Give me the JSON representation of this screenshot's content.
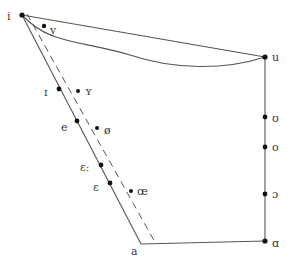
{
  "diagram": {
    "type": "vowel-quadrilateral",
    "colors": {
      "line": "#555555",
      "dot": "#111111",
      "label": "#333333",
      "background": "#ffffff"
    },
    "corners": {
      "i": {
        "label": "i",
        "x": 22,
        "y": 15,
        "lx": 7,
        "ly": 20
      },
      "u": {
        "label": "u",
        "x": 265,
        "y": 57,
        "lx": 272,
        "ly": 61
      },
      "a": {
        "label": "a",
        "x": 141,
        "y": 244,
        "lx": 131,
        "ly": 255
      },
      "ɑ": {
        "label": "ɑ",
        "x": 265,
        "y": 241,
        "lx": 272,
        "ly": 247
      }
    },
    "front_unrounded": [
      {
        "label": "ɪ",
        "x": 59,
        "y": 89,
        "lx": 44,
        "ly": 96
      },
      {
        "label": "e",
        "x": 77,
        "y": 121,
        "lx": 61,
        "ly": 131
      },
      {
        "label": "ɛː",
        "x": 101,
        "y": 165,
        "lx": 80,
        "ly": 171
      },
      {
        "label": "ɛ",
        "x": 110,
        "y": 183,
        "lx": 93,
        "ly": 191
      }
    ],
    "front_rounded": [
      {
        "label": "y",
        "x": 44,
        "y": 26,
        "lx": 50,
        "ly": 34
      },
      {
        "label": "ʏ",
        "x": 78,
        "y": 91,
        "lx": 85,
        "ly": 95
      },
      {
        "label": "ø",
        "x": 97,
        "y": 128,
        "lx": 104,
        "ly": 134
      },
      {
        "label": "œ",
        "x": 131,
        "y": 191,
        "lx": 137,
        "ly": 195
      }
    ],
    "back": [
      {
        "label": "ʊ",
        "x": 265,
        "y": 117,
        "lx": 272,
        "ly": 122
      },
      {
        "label": "o",
        "x": 265,
        "y": 147,
        "lx": 272,
        "ly": 151
      },
      {
        "label": "ɔ",
        "x": 265,
        "y": 194,
        "lx": 272,
        "ly": 198
      }
    ],
    "dashed_line": {
      "x1": 27,
      "y1": 14,
      "x2": 156,
      "y2": 244
    },
    "curve": {
      "from": "i",
      "to": "u",
      "description": "curved line from i dipping below the i–u chord"
    }
  }
}
